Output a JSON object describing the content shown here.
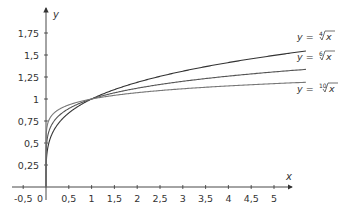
{
  "chart_data": {
    "type": "line",
    "title": "",
    "xlabel": "x",
    "ylabel": "y",
    "xlim": [
      -0.5,
      5.5
    ],
    "ylim": [
      0,
      2
    ],
    "grid": false,
    "x_ticks": [
      "-0,5",
      "0",
      "0,5",
      "1",
      "1,5",
      "2",
      "2,5",
      "3",
      "3,5",
      "4",
      "4,5",
      "5"
    ],
    "y_ticks": [
      "0,25",
      "0,5",
      "0,75",
      "1",
      "1,25",
      "1,5",
      "1,75"
    ],
    "series": [
      {
        "name": "y = ⁴√x",
        "root": 4,
        "x": [
          0,
          0.25,
          0.5,
          1,
          2,
          3,
          4,
          5,
          5.7
        ],
        "values": [
          0,
          0.71,
          0.84,
          1,
          1.19,
          1.32,
          1.41,
          1.5,
          1.55
        ],
        "color": "#333333"
      },
      {
        "name": "y = ⁶√x",
        "root": 6,
        "x": [
          0,
          0.25,
          0.5,
          1,
          2,
          3,
          4,
          5,
          5.7
        ],
        "values": [
          0,
          0.79,
          0.89,
          1,
          1.12,
          1.2,
          1.26,
          1.31,
          1.34
        ],
        "color": "#555555"
      },
      {
        "name": "y = ¹⁰√x",
        "root": 10,
        "x": [
          0,
          0.25,
          0.5,
          1,
          2,
          3,
          4,
          5,
          5.7
        ],
        "values": [
          0,
          0.87,
          0.93,
          1,
          1.07,
          1.12,
          1.15,
          1.17,
          1.19
        ],
        "color": "#777777"
      }
    ],
    "annotations": [
      {
        "text": "y = ⁴√x",
        "prefix": "y = ",
        "index": "4",
        "radicand": "x"
      },
      {
        "text": "y = ⁶√x",
        "prefix": "y = ",
        "index": "6",
        "radicand": "x"
      },
      {
        "text": "y = ¹⁰√x",
        "prefix": "y = ",
        "index": "10",
        "radicand": "x"
      }
    ]
  }
}
